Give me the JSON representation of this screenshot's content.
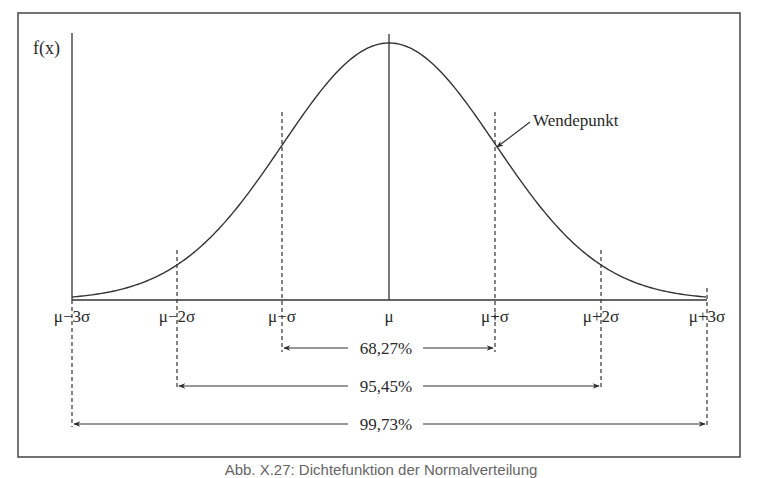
{
  "chart_data": {
    "type": "line",
    "title": "",
    "ylabel": "f(x)",
    "xlabel": "",
    "x_ticks": [
      "μ−3σ",
      "μ−2σ",
      "μ−σ",
      "μ",
      "μ+σ",
      "μ+2σ",
      "μ+3σ"
    ],
    "x": [
      -3,
      -2,
      -1,
      0,
      1,
      2,
      3
    ],
    "series": [
      {
        "name": "f(x)",
        "values": [
          0.0044,
          0.054,
          0.242,
          0.399,
          0.242,
          0.054,
          0.0044
        ]
      }
    ],
    "annotations": [
      {
        "text": "Wendepunkt",
        "points_to": "μ+σ"
      }
    ],
    "intervals": [
      {
        "label": "68,27%",
        "from": "μ−σ",
        "to": "μ+σ"
      },
      {
        "label": "95,45%",
        "from": "μ−2σ",
        "to": "μ+2σ"
      },
      {
        "label": "99,73%",
        "from": "μ−3σ",
        "to": "μ+3σ"
      }
    ],
    "grid": false,
    "legend": null
  },
  "axis": {
    "y_label": "f(x)",
    "ticks": {
      "m3": "μ−3σ",
      "m2": "μ−2σ",
      "m1": "μ−σ",
      "c": "μ",
      "p1": "μ+σ",
      "p2": "μ+2σ",
      "p3": "μ+3σ"
    }
  },
  "annotation": {
    "wendepunkt": "Wendepunkt"
  },
  "intervals": {
    "one_sigma": "68,27%",
    "two_sigma": "95,45%",
    "three_sigma": "99,73%"
  },
  "caption": "Abb. X.27: Dichtefunktion der Normalverteilung"
}
